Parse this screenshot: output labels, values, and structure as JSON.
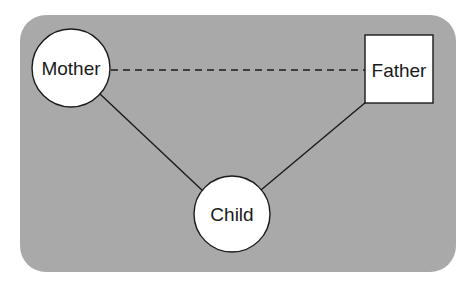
{
  "diagram": {
    "type": "family-relationship",
    "background": {
      "color": "#a9a9a9",
      "x": 20,
      "y": 15,
      "width": 436,
      "height": 257,
      "radius": 26
    },
    "nodes": [
      {
        "id": "mother",
        "label": "Mother",
        "shape": "circle",
        "cx": 71,
        "cy": 68,
        "r": 39,
        "fill": "#ffffff",
        "stroke": "#1a1a1a"
      },
      {
        "id": "father",
        "label": "Father",
        "shape": "square",
        "x": 365,
        "y": 35,
        "width": 68,
        "height": 68,
        "fill": "#ffffff",
        "stroke": "#1a1a1a"
      },
      {
        "id": "child",
        "label": "Child",
        "shape": "circle",
        "cx": 232,
        "cy": 214,
        "r": 38,
        "fill": "#ffffff",
        "stroke": "#1a1a1a"
      }
    ],
    "edges": [
      {
        "from": "mother",
        "to": "father",
        "style": "dashed",
        "x1": 111,
        "y1": 70,
        "x2": 365,
        "y2": 70
      },
      {
        "from": "mother",
        "to": "child",
        "style": "solid",
        "x1": 100,
        "y1": 94,
        "x2": 204,
        "y2": 192
      },
      {
        "from": "father",
        "to": "child",
        "style": "solid",
        "x1": 366,
        "y1": 102,
        "x2": 261,
        "y2": 190
      }
    ],
    "line_color": "#1a1a1a"
  },
  "labels": {
    "mother": "Mother",
    "father": "Father",
    "child": "Child"
  }
}
